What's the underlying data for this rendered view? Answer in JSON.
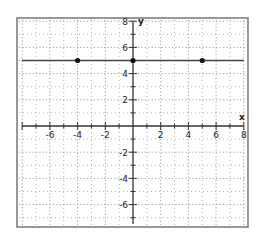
{
  "chart_data": {
    "type": "line",
    "title": "",
    "xlabel": "x",
    "ylabel": "y",
    "xlim": [
      -8,
      8
    ],
    "ylim": [
      -7.5,
      8
    ],
    "grid": true,
    "grid_style": "dotted",
    "x_tick_labels": [
      "-6",
      "-4",
      "-2",
      "2",
      "4",
      "6",
      "8"
    ],
    "x_tick_values": [
      -6,
      -4,
      -2,
      2,
      4,
      6,
      8
    ],
    "y_tick_labels": [
      "8",
      "6",
      "4",
      "2",
      "-2",
      "-4",
      "-6"
    ],
    "y_tick_values": [
      8,
      6,
      4,
      2,
      -2,
      -4,
      -6
    ],
    "series": [
      {
        "name": "y = 5",
        "kind": "horizontal-line",
        "equation": "y = 5",
        "y": 5,
        "points": [
          {
            "x": -4,
            "y": 5
          },
          {
            "x": 0,
            "y": 5
          },
          {
            "x": 5,
            "y": 5
          }
        ]
      }
    ]
  },
  "colors": {
    "axis": "#333333",
    "grid": "#888888",
    "line": "#444444",
    "point": "#111111",
    "frame": "#777777"
  }
}
